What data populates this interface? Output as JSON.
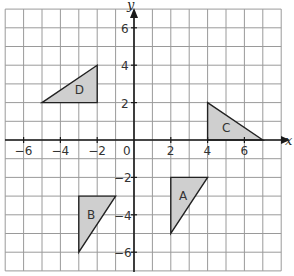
{
  "diagram": {
    "type": "coordinate-grid",
    "axes": {
      "x_label": "x",
      "y_label": "y",
      "x_range": [
        -7,
        8
      ],
      "y_range": [
        -7,
        7
      ],
      "x_ticks": [
        "-6",
        "-4",
        "-2",
        "2",
        "4",
        "6"
      ],
      "y_ticks": [
        "6",
        "4",
        "2",
        "-2",
        "-4",
        "-6"
      ],
      "origin_label": "0"
    },
    "fill_color": "#cfcfcf",
    "shapes": [
      {
        "label": "A",
        "vertices": [
          [
            2,
            -2
          ],
          [
            4,
            -2
          ],
          [
            2,
            -5
          ]
        ]
      },
      {
        "label": "B",
        "vertices": [
          [
            -3,
            -3
          ],
          [
            -1,
            -3
          ],
          [
            -3,
            -6
          ]
        ]
      },
      {
        "label": "C",
        "vertices": [
          [
            4,
            2
          ],
          [
            4,
            0
          ],
          [
            7,
            0
          ]
        ]
      },
      {
        "label": "D",
        "vertices": [
          [
            -5,
            2
          ],
          [
            -2,
            2
          ],
          [
            -2,
            4
          ]
        ]
      }
    ]
  }
}
